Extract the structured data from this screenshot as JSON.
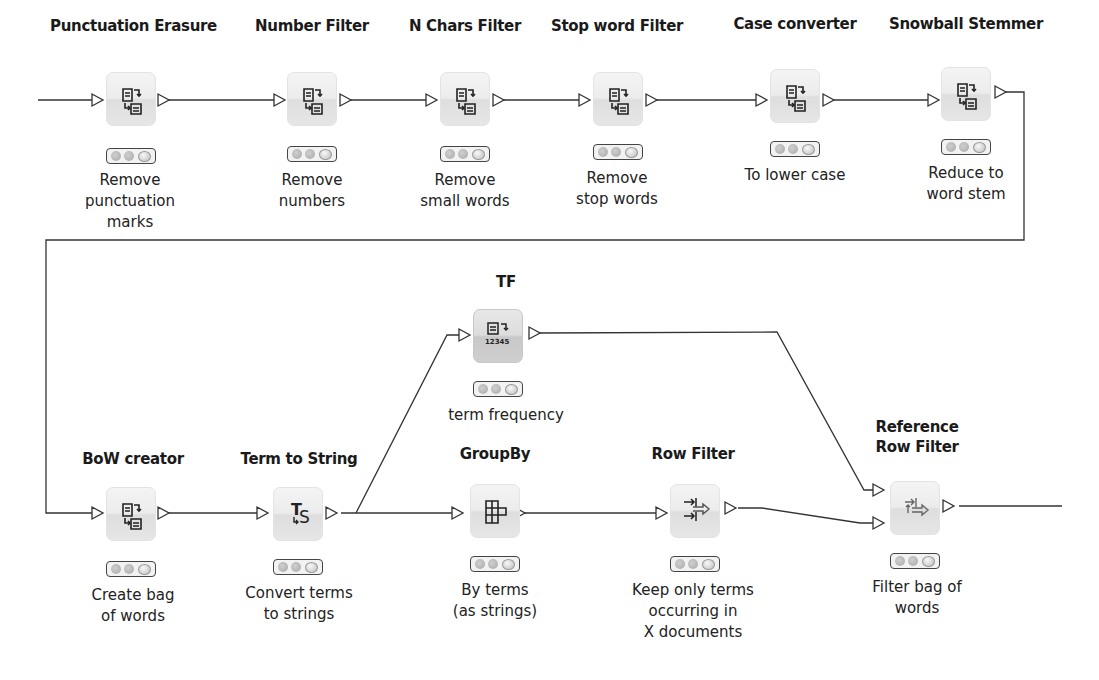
{
  "workflow": {
    "colors": {
      "wire": "#333333",
      "node_bg": "#ececec",
      "status_border": "#444444"
    },
    "nodes": [
      {
        "id": "punctuation-erasure",
        "title": "Punctuation Erasure",
        "description": "Remove\npunctuation\nmarks",
        "icon": "document-transform-icon"
      },
      {
        "id": "number-filter",
        "title": "Number Filter",
        "description": "Remove\nnumbers",
        "icon": "document-transform-icon"
      },
      {
        "id": "n-chars-filter",
        "title": "N Chars Filter",
        "description": "Remove\nsmall words",
        "icon": "document-transform-icon"
      },
      {
        "id": "stop-word-filter",
        "title": "Stop word Filter",
        "description": "Remove\nstop words",
        "icon": "document-transform-icon"
      },
      {
        "id": "case-converter",
        "title": "Case converter",
        "description": "To lower case",
        "icon": "document-transform-icon"
      },
      {
        "id": "snowball-stemmer",
        "title": "Snowball Stemmer",
        "description": "Reduce to\nword stem",
        "icon": "document-transform-icon"
      },
      {
        "id": "bow-creator",
        "title": "BoW creator",
        "description": "Create bag\nof words",
        "icon": "document-transform-icon"
      },
      {
        "id": "term-to-string",
        "title": "Term to String",
        "description": "Convert terms\nto strings",
        "icon": "term-to-string-icon"
      },
      {
        "id": "tf",
        "title": "TF",
        "description": "term frequency",
        "icon": "term-frequency-icon",
        "icon_text": "12345"
      },
      {
        "id": "groupby",
        "title": "GroupBy",
        "description": "By terms\n(as strings)",
        "icon": "groupby-grid-icon"
      },
      {
        "id": "row-filter",
        "title": "Row Filter",
        "description": "Keep only terms\noccurring in\nX documents",
        "icon": "row-filter-icon"
      },
      {
        "id": "reference-row-filter",
        "title": "Reference\nRow Filter",
        "description": "Filter bag of\nwords",
        "icon": "reference-row-filter-icon"
      }
    ],
    "connections": [
      [
        "input",
        "punctuation-erasure"
      ],
      [
        "punctuation-erasure",
        "number-filter"
      ],
      [
        "number-filter",
        "n-chars-filter"
      ],
      [
        "n-chars-filter",
        "stop-word-filter"
      ],
      [
        "stop-word-filter",
        "case-converter"
      ],
      [
        "case-converter",
        "snowball-stemmer"
      ],
      [
        "snowball-stemmer",
        "bow-creator"
      ],
      [
        "bow-creator",
        "term-to-string"
      ],
      [
        "term-to-string",
        "tf"
      ],
      [
        "term-to-string",
        "groupby"
      ],
      [
        "groupby",
        "row-filter"
      ],
      [
        "tf",
        "reference-row-filter"
      ],
      [
        "row-filter",
        "reference-row-filter"
      ],
      [
        "reference-row-filter",
        "output"
      ]
    ]
  }
}
